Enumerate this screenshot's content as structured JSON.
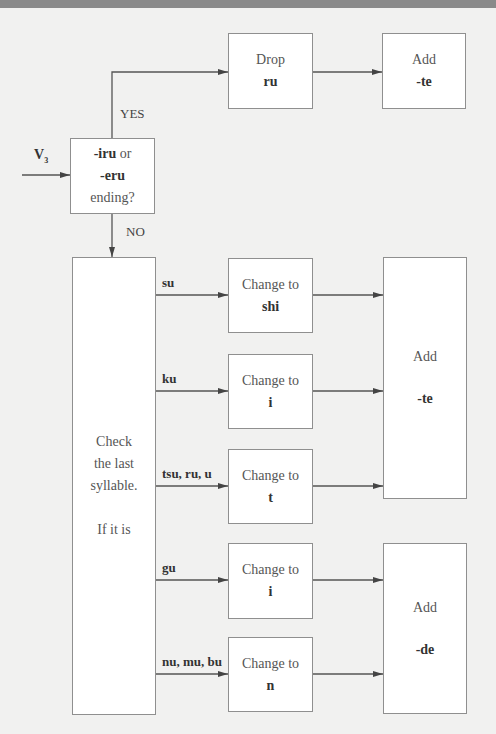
{
  "input": {
    "label": "V",
    "subscript": "3"
  },
  "decision": {
    "line1_bold": "-iru",
    "line1_rest": " or",
    "line2_bold": "-eru",
    "line3": "ending?"
  },
  "branches": {
    "yes": "YES",
    "no": "NO"
  },
  "drop_box": {
    "line1": "Drop",
    "line2": "ru"
  },
  "add_te_top": {
    "line1": "Add",
    "line2": "-te"
  },
  "check_box": {
    "line1": "Check",
    "line2": "the last",
    "line3": "syllable.",
    "line4": "If it is"
  },
  "cases": [
    {
      "syllable": "su",
      "action": "Change to",
      "result": "shi"
    },
    {
      "syllable": "ku",
      "action": "Change to",
      "result": "i"
    },
    {
      "syllable": "tsu, ru, u",
      "action": "Change to",
      "result": "t"
    },
    {
      "syllable": "gu",
      "action": "Change to",
      "result": "i"
    },
    {
      "syllable": "nu, mu, bu",
      "action": "Change to",
      "result": "n"
    }
  ],
  "add_te": {
    "line1": "Add",
    "line2": "-te"
  },
  "add_de": {
    "line1": "Add",
    "line2": "-de"
  }
}
